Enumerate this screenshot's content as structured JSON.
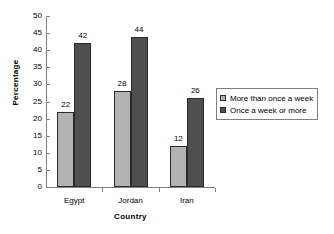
{
  "chart_data": {
    "type": "bar",
    "title": "",
    "subtitle": "",
    "xlabel": "Country",
    "ylabel": "Percentage",
    "categories": [
      "Egypt",
      "Jordan",
      "Iran"
    ],
    "series": [
      {
        "name": "More than once a week",
        "color": "#b2b2b2",
        "values": [
          22,
          28,
          12
        ]
      },
      {
        "name": "Once a week or more",
        "color": "#4f4f4f",
        "values": [
          42,
          44,
          26
        ]
      }
    ],
    "ylim": [
      0,
      50
    ],
    "ytick_step": 5,
    "yticks": [
      0,
      5,
      10,
      15,
      20,
      25,
      30,
      35,
      40,
      45,
      50
    ],
    "ytick_labels": [
      "0",
      "5",
      "10",
      "15",
      "20",
      "25",
      "30",
      "35",
      "40",
      "45",
      "50"
    ],
    "grid": false,
    "data_labels": true,
    "legend_position": "right",
    "axis_color": "#808080",
    "bar_border_color": "#2b2b2b",
    "background": "#ffffff"
  },
  "legend": {
    "entries": [
      {
        "label": "More than once a week"
      },
      {
        "label": "Once a week or more"
      }
    ]
  }
}
